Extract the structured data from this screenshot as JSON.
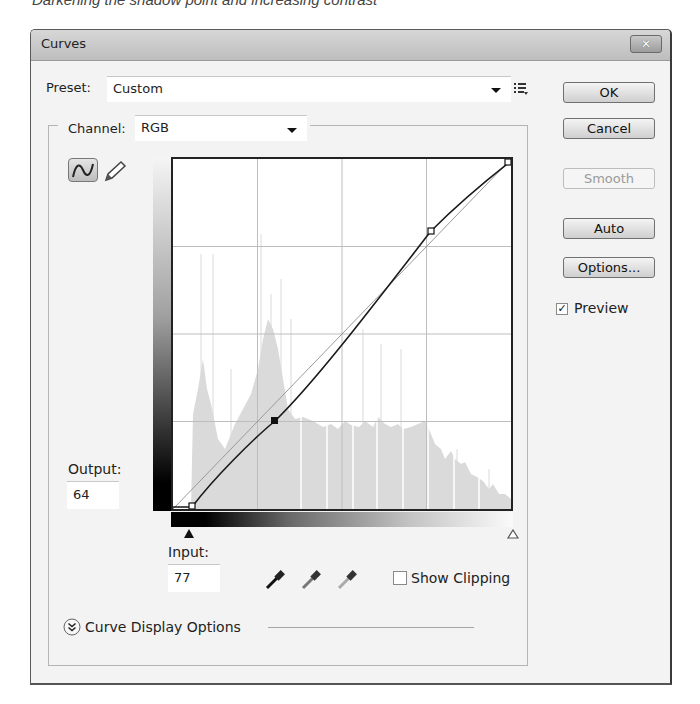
{
  "caption": "Darkening the shadow point and increasing contrast",
  "dialog": {
    "title": "Curves",
    "close_icon": "close-icon"
  },
  "preset": {
    "label": "Preset:",
    "value": "Custom",
    "menu_icon": "preset-options-icon"
  },
  "channel": {
    "label": "Channel:",
    "value": "RGB"
  },
  "tools": {
    "curve_tool": "curve-point-icon",
    "pencil_tool": "pencil-icon"
  },
  "buttons": {
    "ok": "OK",
    "cancel": "Cancel",
    "smooth": "Smooth",
    "auto": "Auto",
    "options": "Options..."
  },
  "preview": {
    "label": "Preview",
    "checked": true
  },
  "output": {
    "label": "Output:",
    "value": "64"
  },
  "input": {
    "label": "Input:",
    "value": "77"
  },
  "eyedroppers": [
    "black-point-eyedropper-icon",
    "gray-point-eyedropper-icon",
    "white-point-eyedropper-icon"
  ],
  "show_clipping": {
    "label": "Show Clipping",
    "checked": false
  },
  "curve_display_options": {
    "label": "Curve Display Options"
  },
  "curve": {
    "points": [
      [
        18,
        0
      ],
      [
        77,
        64
      ],
      [
        196,
        210
      ],
      [
        255,
        255
      ]
    ],
    "selected_point_index": 1,
    "grid": "4x4"
  },
  "colors": {
    "dialog_bg": "#f3f3f3",
    "histogram": "#d9d9d9",
    "curve": "#1a1a1a",
    "baseline": "#b0b0b0"
  }
}
